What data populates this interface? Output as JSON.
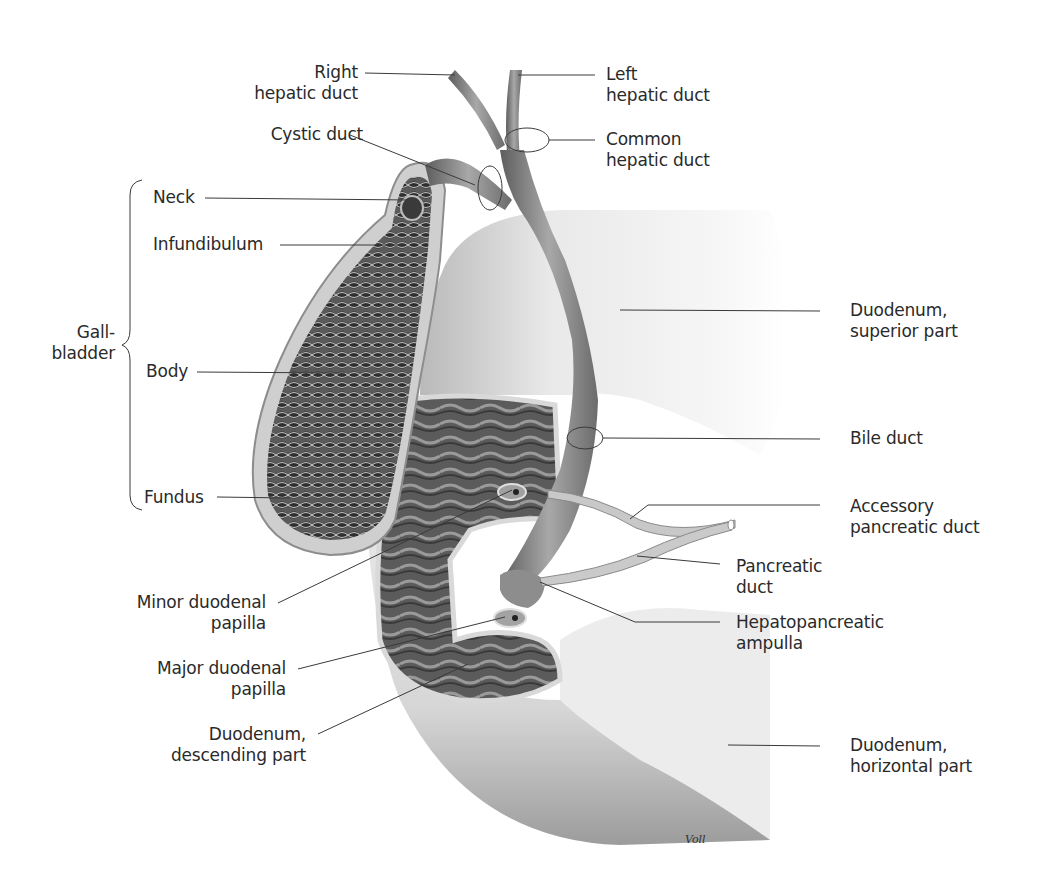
{
  "figure": {
    "signature": "Voll"
  },
  "labels": {
    "right_hepatic_duct": "Right\nhepatic duct",
    "left_hepatic_duct": "Left\nhepatic duct",
    "cystic_duct": "Cystic duct",
    "common_hepatic_duct": "Common\nhepatic duct",
    "neck": "Neck",
    "infundibulum": "Infundibulum",
    "gallbladder": "Gall-\nbladder",
    "body": "Body",
    "fundus": "Fundus",
    "duodenum_superior": "Duodenum,\nsuperior part",
    "bile_duct": "Bile duct",
    "accessory_pancreatic_duct": "Accessory\npancreatic duct",
    "pancreatic_duct": "Pancreatic\nduct",
    "hepatopancreatic_ampulla": "Hepatopancreatic\nampulla",
    "minor_duodenal_papilla": "Minor duodenal\npapilla",
    "major_duodenal_papilla": "Major duodenal\npapilla",
    "duodenum_descending": "Duodenum,\ndescending part",
    "duodenum_horizontal": "Duodenum,\nhorizontal part"
  },
  "colors": {
    "leader_line": "#3a3a3a",
    "text": "#2a2a2a",
    "duct": "#8a8a8a",
    "duodenum_light": "#eeeeee",
    "mucosa_dark": "#555555"
  }
}
